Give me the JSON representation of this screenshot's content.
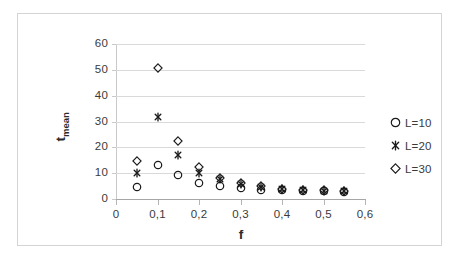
{
  "chart_data": {
    "type": "scatter",
    "title": "",
    "xlabel": "f",
    "ylabel": "t_mean",
    "ylabel_base": "t",
    "ylabel_sub": "mean",
    "xlim": [
      0,
      0.6
    ],
    "ylim": [
      0,
      60
    ],
    "grid": true,
    "legend_position": "right",
    "xticks": [
      "0",
      "0,1",
      "0,2",
      "0,3",
      "0,4",
      "0,5",
      "0,6"
    ],
    "xtick_values": [
      0,
      0.1,
      0.2,
      0.3,
      0.4,
      0.5,
      0.6
    ],
    "yticks": [
      "0",
      "10",
      "20",
      "30",
      "40",
      "50",
      "60"
    ],
    "ytick_values": [
      0,
      10,
      20,
      30,
      40,
      50,
      60
    ],
    "x": [
      0.05,
      0.1,
      0.15,
      0.2,
      0.25,
      0.3,
      0.35,
      0.4,
      0.45,
      0.5,
      0.55
    ],
    "series": [
      {
        "name": "L=10",
        "marker": "circle-open",
        "color": "#1a1a1a",
        "values": [
          4.7,
          13.3,
          9.3,
          6.2,
          5.0,
          4.2,
          3.6,
          3.4,
          3.2,
          3.1,
          2.9
        ]
      },
      {
        "name": "L=20",
        "marker": "asterisk",
        "color": "#1a1a1a",
        "values": [
          10.2,
          31.8,
          16.9,
          10.0,
          7.6,
          5.8,
          4.6,
          3.9,
          3.4,
          3.2,
          3.0
        ]
      },
      {
        "name": "L=30",
        "marker": "diamond-open",
        "color": "#1a1a1a",
        "values": [
          14.6,
          50.8,
          22.5,
          12.2,
          8.0,
          6.1,
          4.9,
          4.0,
          3.5,
          3.3,
          3.1
        ]
      }
    ]
  },
  "legend": {
    "items": [
      {
        "label": "L=10",
        "marker": "circle-open"
      },
      {
        "label": "L=20",
        "marker": "asterisk"
      },
      {
        "label": "L=30",
        "marker": "diamond-open"
      }
    ]
  },
  "colors": {
    "marker": "#1a1a1a",
    "gridline": "#d9d9d9",
    "axis": "#a6a6a6",
    "text": "#3a3a3a",
    "frame": "#d4d4d4",
    "background": "#ffffff"
  }
}
